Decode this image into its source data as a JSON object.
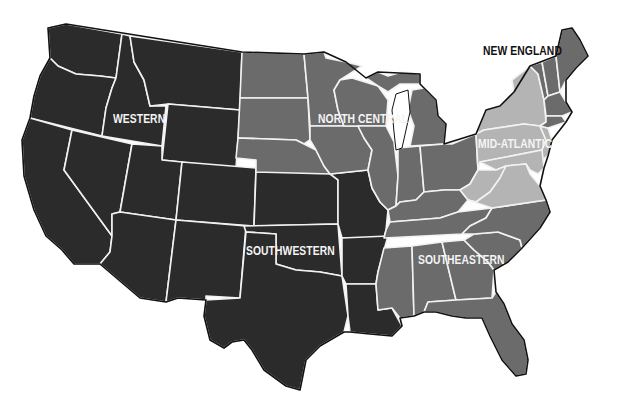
{
  "map": {
    "title": "United States Regions",
    "colors": {
      "western": "#2b2b2b",
      "southwestern": "#2b2b2b",
      "north_central": "#6b6b6b",
      "southeastern": "#6b6b6b",
      "new_england": "#6b6b6b",
      "mid_atlantic": "#b4b4b4",
      "border": "#f2f2f2",
      "background": "#ffffff"
    },
    "regions": [
      {
        "id": "western",
        "label": "WESTERN",
        "x": 113,
        "y": 113,
        "tone": "light"
      },
      {
        "id": "north-central",
        "label": "NORTH CENTRAL",
        "x": 318,
        "y": 113,
        "tone": "light"
      },
      {
        "id": "new-england",
        "label": "NEW ENGLAND",
        "x": 482,
        "y": 45,
        "tone": "dark"
      },
      {
        "id": "mid-atlantic",
        "label": "MID-ATLANTIC",
        "x": 478,
        "y": 138,
        "tone": "light"
      },
      {
        "id": "southwestern",
        "label": "SOUTHWESTERN",
        "x": 246,
        "y": 245,
        "tone": "light"
      },
      {
        "id": "southeastern",
        "label": "SOUTHEASTERN",
        "x": 418,
        "y": 254,
        "tone": "light"
      }
    ]
  }
}
